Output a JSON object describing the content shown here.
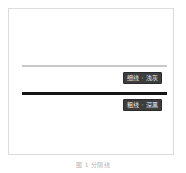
{
  "card": {
    "border_color": "#dcdcdc",
    "background": "#ffffff"
  },
  "samples": [
    {
      "name": "thin-light-rule",
      "rule_color": "#c9c9c9",
      "rule_thickness": "2px",
      "chip_label": "细线 · 浅灰",
      "chip_bg": "#3d3d3d",
      "chip_text_color": "#e9e9e9"
    },
    {
      "name": "thick-dark-rule",
      "rule_color": "#141414",
      "rule_thickness": "3px",
      "chip_label": "粗线 · 深黑",
      "chip_bg": "#3d3d3d",
      "chip_text_color": "#e9e9e9"
    }
  ],
  "caption": {
    "text": "图 1  分隔线"
  }
}
